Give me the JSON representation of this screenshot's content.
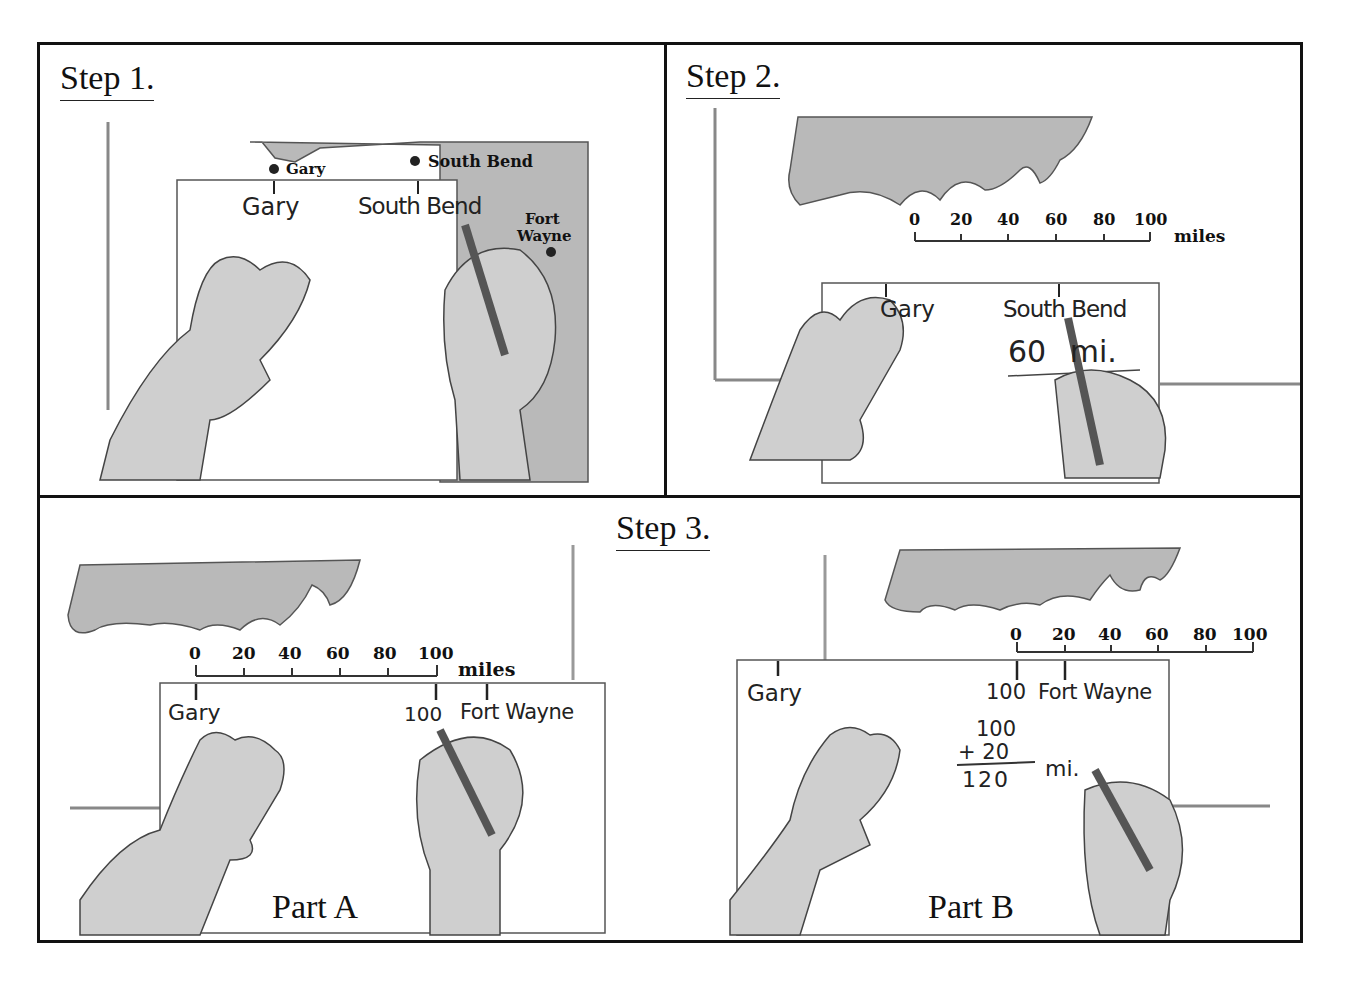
{
  "steps": {
    "step1": {
      "title": "Step 1.",
      "map_labels": {
        "gary": "Gary",
        "south_bend": "South Bend",
        "fort_wayne_1": "Fort",
        "fort_wayne_2": "Wayne"
      },
      "paper_labels": {
        "gary": "Gary",
        "south_bend": "South Bend"
      }
    },
    "step2": {
      "title": "Step 2.",
      "scale": {
        "ticks": [
          "0",
          "20",
          "40",
          "60",
          "80",
          "100"
        ],
        "unit": "miles"
      },
      "paper_labels": {
        "gary": "Gary",
        "south_bend": "South Bend",
        "distance": "60 mi."
      }
    },
    "step3": {
      "title": "Step 3.",
      "partA": {
        "label": "Part A",
        "scale": {
          "ticks": [
            "0",
            "20",
            "40",
            "60",
            "80",
            "100"
          ],
          "unit": "miles"
        },
        "paper_labels": {
          "gary": "Gary",
          "mark": "100",
          "fort_wayne": "Fort Wayne"
        }
      },
      "partB": {
        "label": "Part B",
        "scale": {
          "ticks": [
            "0",
            "20",
            "40",
            "60",
            "80",
            "100"
          ]
        },
        "paper_labels": {
          "gary": "Gary",
          "mark": "100",
          "fort_wayne": "Fort Wayne"
        },
        "sum": {
          "a": "100",
          "b": "+ 20",
          "total": "120",
          "unit": "mi."
        }
      }
    }
  },
  "colors": {
    "border": "#111111",
    "map_fill": "#b5b5b5",
    "paper": "#ffffff",
    "shade": "#8a8a8a"
  }
}
